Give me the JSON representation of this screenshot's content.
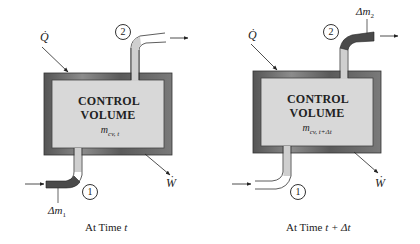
{
  "diagrams": [
    {
      "id": "time-t",
      "title_line1": "CONTROL",
      "title_line2": "VOLUME",
      "mass_symbol": "m",
      "mass_subscript": "cv, t",
      "heat_label": "Q̇",
      "work_label": "Ẇ",
      "inlet_state": "1",
      "outlet_state": "2",
      "mass_element_label": "Δm",
      "mass_element_subscript": "1",
      "caption_prefix": "At Time ",
      "caption_var": "t"
    },
    {
      "id": "time-t-plus-dt",
      "title_line1": "CONTROL",
      "title_line2": "VOLUME",
      "mass_symbol": "m",
      "mass_subscript": "cv, t+Δt",
      "heat_label": "Q̇",
      "work_label": "Ẇ",
      "inlet_state": "1",
      "outlet_state": "2",
      "mass_element_label": "Δm",
      "mass_element_subscript": "2",
      "caption_prefix": "At Time ",
      "caption_var": "t + Δt"
    }
  ],
  "colors": {
    "wall_dark": "#4a4a4a",
    "wall_light": "#8a8a8a",
    "interior": "#d6d6d6",
    "pipe": "#c8c8c8",
    "mass_element": "#4a4a4a"
  }
}
